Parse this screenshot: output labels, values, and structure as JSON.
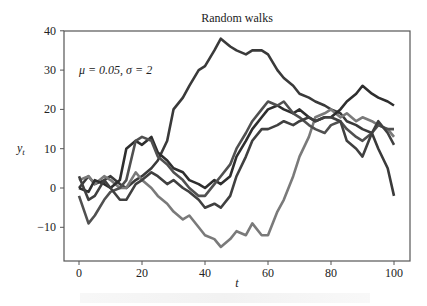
{
  "chart_data": {
    "type": "line",
    "title": "Random walks",
    "annotation": "μ = 0.05, σ = 2",
    "xlabel": "t",
    "ylabel": "y_t",
    "xlim": [
      -5,
      105
    ],
    "ylim": [
      -18.6,
      40
    ],
    "xticks": [
      0,
      20,
      40,
      60,
      80,
      100
    ],
    "yticks": [
      -10,
      0,
      10,
      20,
      30,
      40
    ],
    "xtick_labels": [
      "0",
      "20",
      "40",
      "60",
      "80",
      "100"
    ],
    "ytick_labels": [
      "−10",
      "0",
      "10",
      "20",
      "30",
      "40"
    ],
    "grid": false,
    "legend": null,
    "x": [
      0,
      3,
      5,
      8,
      10,
      13,
      15,
      18,
      20,
      23,
      25,
      28,
      30,
      33,
      35,
      38,
      40,
      43,
      45,
      48,
      50,
      53,
      55,
      58,
      60,
      63,
      65,
      68,
      70,
      73,
      75,
      78,
      80,
      83,
      85,
      88,
      90,
      93,
      95,
      98,
      100
    ],
    "series": [
      {
        "name": "walk 1",
        "color": "#3a3a3a",
        "values": [
          0,
          3,
          1,
          2,
          3,
          1,
          0,
          2,
          3,
          5,
          7,
          12,
          20,
          23,
          26,
          30,
          31,
          35,
          38,
          36,
          35,
          34,
          35,
          35,
          34,
          30,
          28,
          26,
          24,
          23,
          22,
          21,
          20,
          19,
          17,
          16,
          15,
          14,
          10,
          5,
          -2
        ]
      },
      {
        "name": "walk 2",
        "color": "#7a7a7a",
        "values": [
          2,
          3,
          1,
          3,
          2,
          0,
          0,
          4,
          2,
          0,
          -2,
          -4,
          -6,
          -8,
          -7,
          -10,
          -12,
          -13,
          -15,
          -13,
          -11,
          -12,
          -9,
          -12,
          -12,
          -6,
          -3,
          3,
          8,
          13,
          18,
          19,
          20,
          18,
          19,
          17,
          18,
          17,
          16,
          15,
          13
        ]
      },
      {
        "name": "walk 3",
        "color": "#2e2e2e",
        "values": [
          0,
          -1,
          2,
          1,
          0,
          2,
          10,
          12,
          11,
          13,
          9,
          7,
          5,
          4,
          2,
          1,
          0,
          2,
          1,
          3,
          8,
          12,
          15,
          18,
          20,
          21,
          20,
          19,
          20,
          18,
          17,
          18,
          18,
          20,
          22,
          24,
          26,
          24,
          23,
          22,
          21
        ]
      },
      {
        "name": "walk 4",
        "color": "#505050",
        "values": [
          -2,
          -9,
          -7,
          -3,
          -1,
          0,
          2,
          12,
          13,
          12,
          8,
          6,
          4,
          2,
          0,
          -2,
          -2,
          1,
          3,
          6,
          10,
          14,
          17,
          20,
          22,
          21,
          22,
          19,
          18,
          16,
          15,
          14,
          16,
          17,
          15,
          13,
          12,
          14,
          16,
          15,
          15
        ]
      },
      {
        "name": "walk 5",
        "color": "#404040",
        "values": [
          3,
          -3,
          -2,
          2,
          0,
          -3,
          -3,
          1,
          2,
          4,
          3,
          1,
          2,
          0,
          -1,
          -3,
          -5,
          -4,
          -5,
          -2,
          3,
          8,
          12,
          15,
          15,
          16,
          17,
          16,
          17,
          18,
          17,
          18,
          18,
          17,
          12,
          10,
          8,
          14,
          17,
          14,
          11
        ]
      }
    ]
  }
}
